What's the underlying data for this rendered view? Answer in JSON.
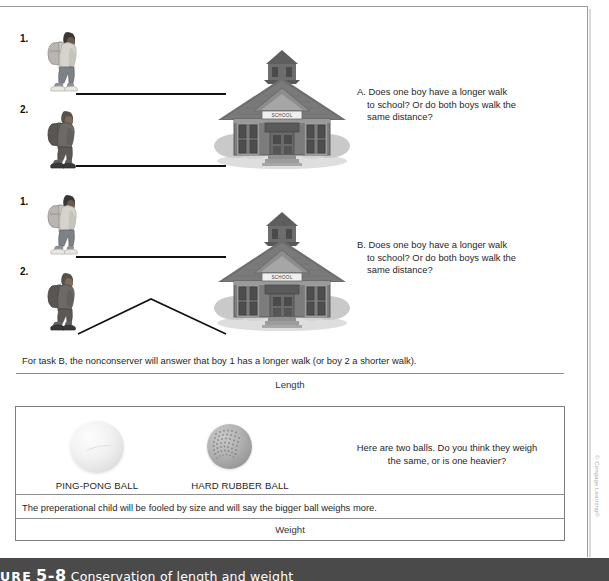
{
  "figure": {
    "caption_label": "URE",
    "caption_number": "5-8",
    "caption_description": "Conservation of length and weight",
    "credit": "© Cengage Learning®"
  },
  "colors": {
    "caption_bar": "#4a4a4a",
    "rule": "#8d8d8d",
    "frame": "#9b9b9b",
    "path_line": "#111111"
  },
  "length_section": {
    "task_a": {
      "boy1_label": "1.",
      "boy2_label": "2.",
      "question": "A. Does one boy have a longer walk to school? Or do both boys walk the same distance?",
      "question_lead": "A.",
      "question_body": "Does one boy have a longer walk to school? Or do both boys walk the same distance?",
      "school_sign": "SCHOOL"
    },
    "task_b": {
      "boy1_label": "1.",
      "boy2_label": "2.",
      "question": "B. Does one boy have a longer walk to school? Or do both boys walk the same distance?",
      "question_lead": "B.",
      "question_body": "Does one boy have a longer walk to school? Or do both boys walk the same distance?",
      "school_sign": "SCHOOL"
    },
    "note": "For task B, the nonconserver will answer that boy 1 has a longer walk (or boy 2 a shorter walk).",
    "section_label": "Length"
  },
  "weight_section": {
    "ball_1_label": "PING-PONG BALL",
    "ball_2_label": "HARD RUBBER BALL",
    "question": "Here are two balls. Do you think they weigh the same, or is one heavier?",
    "note": "The preperational child will be fooled by size and will say the bigger ball weighs more.",
    "section_label": "Weight"
  }
}
